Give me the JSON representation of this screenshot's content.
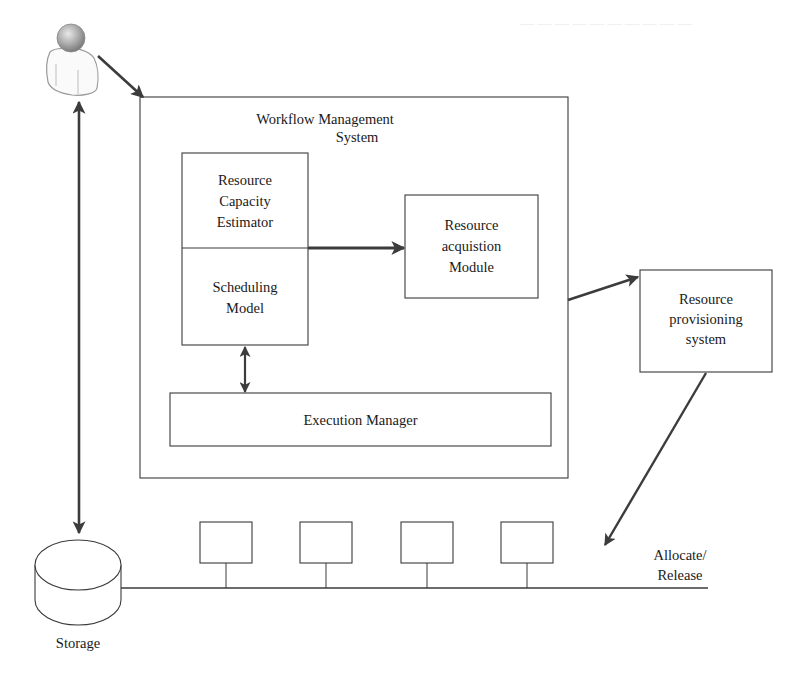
{
  "diagram": {
    "actor": {
      "name": "user"
    },
    "workflow_system": {
      "title_line1": "Workflow Management",
      "title_line2": "System",
      "estimator": {
        "line1": "Resource",
        "line2": "Capacity",
        "line3": "Estimator"
      },
      "scheduling": {
        "line1": "Scheduling",
        "line2": "Model"
      },
      "acquisition": {
        "line1": "Resource",
        "line2": "acquistion",
        "line3": "Module"
      },
      "execution_manager": "Execution Manager"
    },
    "provisioning": {
      "line1": "Resource",
      "line2": "provisioning",
      "line3": "system"
    },
    "storage": {
      "label": "Storage"
    },
    "resource_pool": {
      "node_count": 4
    },
    "allocate_release": {
      "line1": "Allocate/",
      "line2": "Release"
    }
  },
  "colors": {
    "line": "#3a3a3a",
    "arrow": "#3c3c3c",
    "text": "#1a1a1a",
    "head_gray": "#a8a8a8",
    "bleed_text": "#e6e6e6"
  }
}
